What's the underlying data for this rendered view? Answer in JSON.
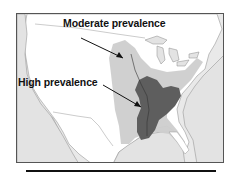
{
  "map": {
    "region": "United States",
    "legend_labels": {
      "moderate": "Moderate prevalence",
      "high": "High prevalence"
    },
    "colors": {
      "ocean": "#e8e8e8",
      "land": "#ffffff",
      "moderate": "#cfcfcf",
      "high": "#5a5a5a",
      "border": "#555555"
    }
  }
}
